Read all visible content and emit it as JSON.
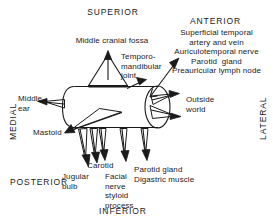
{
  "figure": {
    "kind": "anatomical-schematic",
    "stroke_color": "#1a1a1a",
    "background_color": "#ffffff"
  },
  "orientation": {
    "superior": "SUPERIOR",
    "inferior": "INFERIOR",
    "medial": "MEDIAL",
    "lateral": "LATERAL",
    "anterior": "ANTERIOR",
    "posterior": "POSTERIOR"
  },
  "labels": {
    "middle_cranial_fossa": "Middle cranial fossa",
    "temporomandibular_joint": "Temporo-\nmandibular\njoint",
    "anterior_structures": "Superficial temporal\nartery and vein\nAuriculotemporal nerve\nParotid  gland\nPreauricular lymph node",
    "middle_ear": "Middle\near",
    "outside_world": "Outside\nworld",
    "mastoid": "Mastoid",
    "jugular_bulb": "Jugular\nbulb",
    "carotid": "Carotid",
    "facial_nerve_styloid": "Facial\nnerve\nstyloid\nprocess",
    "parotid_digastric": "Parotid gland\nDigastric muscle"
  },
  "anterior_lines": [
    "Superficial temporal",
    "artery and vein",
    "Auriculotemporal nerve",
    "Parotid  gland",
    "Preauricular lymph node"
  ]
}
